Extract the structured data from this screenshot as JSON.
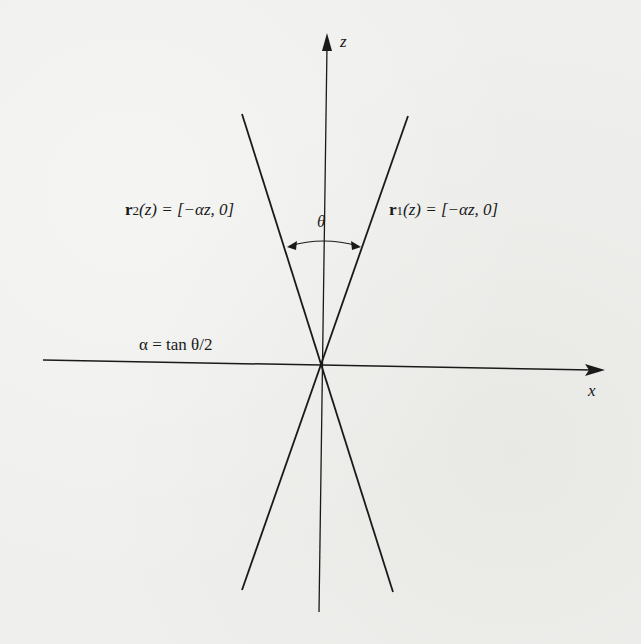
{
  "diagram": {
    "axes": {
      "z_label": "z",
      "x_label": "x"
    },
    "angle_label": "θ",
    "lines": {
      "r1": {
        "name": "r",
        "subscript": "1",
        "equation": "(z) = [−αz, 0]"
      },
      "r2": {
        "name": "r",
        "subscript": "2",
        "equation": "(z) = [−αz, 0]"
      }
    },
    "alpha_definition": "α = tan θ/2",
    "colors": {
      "ink": "#1a1a1a",
      "paper": "#efefed"
    }
  }
}
